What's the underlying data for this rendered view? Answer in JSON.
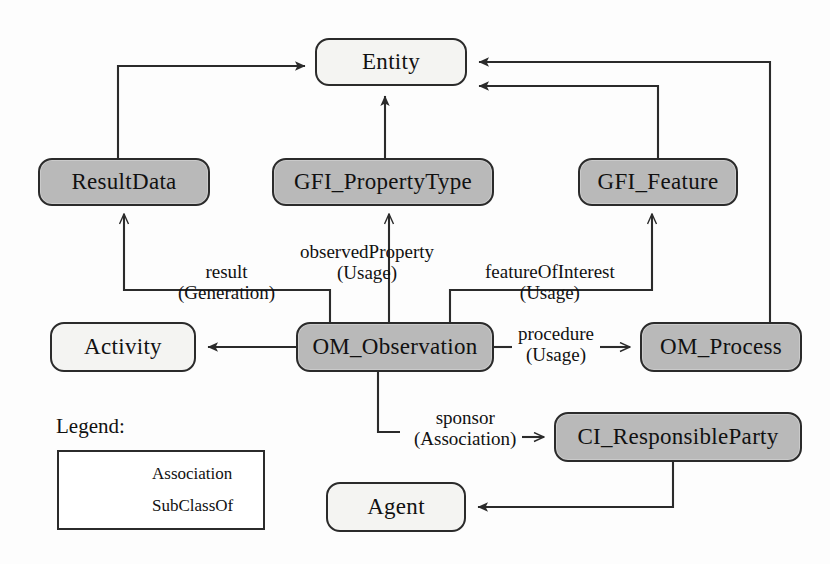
{
  "diagram": {
    "colors": {
      "shaded_fill": "#b9b9b9",
      "plain_fill": "#f4f4f2",
      "stroke": "#2b2b2b",
      "background": "#fdfdfd"
    },
    "nodes": [
      {
        "id": "entity",
        "label": "Entity",
        "style": "plain",
        "x": 315,
        "y": 38,
        "w": 152,
        "h": 48,
        "font_size": 23
      },
      {
        "id": "result_data",
        "label": "ResultData",
        "style": "shaded",
        "x": 38,
        "y": 158,
        "w": 172,
        "h": 48,
        "font_size": 23
      },
      {
        "id": "gfi_property_type",
        "label": "GFI_PropertyType",
        "style": "shaded",
        "x": 272,
        "y": 158,
        "w": 222,
        "h": 48,
        "font_size": 23
      },
      {
        "id": "gfi_feature",
        "label": "GFI_Feature",
        "style": "shaded",
        "x": 578,
        "y": 158,
        "w": 160,
        "h": 48,
        "font_size": 23
      },
      {
        "id": "activity",
        "label": "Activity",
        "style": "plain",
        "x": 50,
        "y": 322,
        "w": 146,
        "h": 50,
        "font_size": 23
      },
      {
        "id": "om_observation",
        "label": "OM_Observation",
        "style": "shaded",
        "x": 296,
        "y": 322,
        "w": 198,
        "h": 50,
        "font_size": 23
      },
      {
        "id": "om_process",
        "label": "OM_Process",
        "style": "shaded",
        "x": 640,
        "y": 322,
        "w": 162,
        "h": 50,
        "font_size": 23
      },
      {
        "id": "ci_responsible",
        "label": "CI_ResponsibleParty",
        "style": "shaded",
        "x": 554,
        "y": 412,
        "w": 248,
        "h": 50,
        "font_size": 23
      },
      {
        "id": "agent",
        "label": "Agent",
        "style": "plain",
        "x": 326,
        "y": 482,
        "w": 140,
        "h": 50,
        "font_size": 23
      }
    ],
    "edge_labels": [
      {
        "id": "result",
        "top": "result",
        "bottom": "(Generation)",
        "x": 178,
        "y": 262,
        "font_size": 19
      },
      {
        "id": "observed_property",
        "top": "observedProperty",
        "bottom": "(Usage)",
        "x": 300,
        "y": 242,
        "font_size": 19
      },
      {
        "id": "feature_of_interest",
        "top": "featureOfInterest",
        "bottom": "(Usage)",
        "x": 485,
        "y": 262,
        "font_size": 19
      },
      {
        "id": "procedure",
        "top": "procedure",
        "bottom": "(Usage)",
        "x": 518,
        "y": 324,
        "font_size": 19
      },
      {
        "id": "sponsor",
        "top": "sponsor",
        "bottom": "(Association)",
        "x": 414,
        "y": 408,
        "font_size": 19
      }
    ],
    "legend": {
      "title": "Legend:",
      "title_x": 56,
      "title_y": 414,
      "box": {
        "x": 57,
        "y": 450,
        "w": 208,
        "h": 80
      },
      "rows": [
        {
          "id": "association",
          "label": "Association",
          "arrow": "open",
          "x": 72,
          "y": 463,
          "font_size": 17
        },
        {
          "id": "subclassof",
          "label": "SubClassOf",
          "arrow": "filled",
          "x": 72,
          "y": 495,
          "font_size": 17
        }
      ]
    },
    "edges": [
      {
        "id": "resultdata-entity",
        "from": "ResultData",
        "to": "Entity",
        "arrow": "filled",
        "kind": "SubClassOf"
      },
      {
        "id": "propertytype-entity",
        "from": "GFI_PropertyType",
        "to": "Entity",
        "arrow": "filled",
        "kind": "SubClassOf"
      },
      {
        "id": "gfifeature-entity",
        "from": "GFI_Feature",
        "to": "Entity",
        "arrow": "filled",
        "kind": "SubClassOf"
      },
      {
        "id": "omprocess-entity",
        "from": "OM_Process",
        "to": "Entity",
        "arrow": "filled",
        "kind": "SubClassOf"
      },
      {
        "id": "observation-resultdata",
        "from": "OM_Observation",
        "to": "ResultData",
        "arrow": "open",
        "kind": "result (Generation)"
      },
      {
        "id": "observation-propertytype",
        "from": "OM_Observation",
        "to": "GFI_PropertyType",
        "arrow": "open",
        "kind": "observedProperty (Usage)"
      },
      {
        "id": "observation-gfifeature",
        "from": "OM_Observation",
        "to": "GFI_Feature",
        "arrow": "open",
        "kind": "featureOfInterest (Usage)"
      },
      {
        "id": "observation-activity",
        "from": "OM_Observation",
        "to": "Activity",
        "arrow": "filled",
        "kind": "SubClassOf"
      },
      {
        "id": "observation-omprocess",
        "from": "OM_Observation",
        "to": "OM_Process",
        "arrow": "open",
        "kind": "procedure (Usage)"
      },
      {
        "id": "observation-responsible",
        "from": "OM_Observation",
        "to": "CI_ResponsibleParty",
        "arrow": "open",
        "kind": "sponsor (Association)"
      },
      {
        "id": "responsible-agent",
        "from": "CI_ResponsibleParty",
        "to": "Agent",
        "arrow": "filled",
        "kind": "SubClassOf"
      }
    ]
  }
}
